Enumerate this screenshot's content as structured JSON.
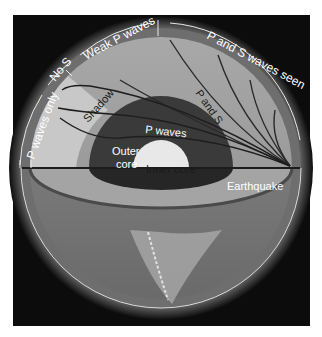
{
  "diagram": {
    "labels": {
      "p_waves_only": "P waves only",
      "no_s": "No S",
      "weak_p_waves": "Weak P waves",
      "p_and_s_waves_seen": "P and S waves seen",
      "shadow": "Shadow",
      "p_and_s": "P and S",
      "p_waves": "P waves",
      "outer_core_line1": "Outer",
      "outer_core_line2": "core",
      "inner_core": "Inner core",
      "earthquake": "Earthquake"
    },
    "colors": {
      "background": "#0c0c0c",
      "mantle": "#9a9a9a",
      "shadow_zone": "#c4c4c4",
      "outer_core": "#3a3a3a",
      "inner_core": "#e6e6e6",
      "crust_ring": "#6e6e6e",
      "ray_lines": "#2a2a2a",
      "label_text": "#ffffff"
    }
  }
}
